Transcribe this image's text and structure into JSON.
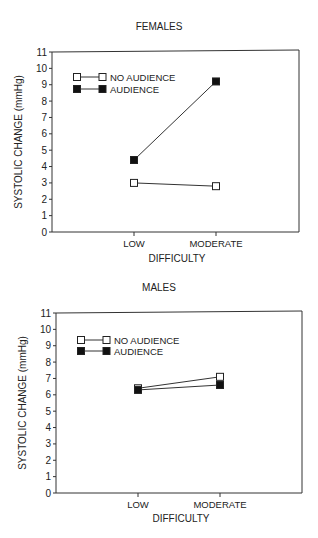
{
  "chart_data": [
    {
      "type": "line",
      "title": "FEMALES",
      "xlabel": "DIFFICULTY",
      "ylabel": "SYSTOLIC CHANGE (mmHg)",
      "categories": [
        "LOW",
        "MODERATE"
      ],
      "ylim": [
        0,
        11
      ],
      "yticks": [
        0,
        1,
        2,
        3,
        4,
        5,
        6,
        7,
        8,
        9,
        10,
        11
      ],
      "grid": false,
      "legend_position": "upper-left",
      "series": [
        {
          "name": "NO AUDIENCE",
          "marker": "open-square",
          "values": [
            3.0,
            2.8
          ]
        },
        {
          "name": "AUDIENCE",
          "marker": "filled-square",
          "values": [
            4.4,
            9.2
          ]
        }
      ]
    },
    {
      "type": "line",
      "title": "MALES",
      "xlabel": "DIFFICULTY",
      "ylabel": "SYSTOLIC CHANGE (mmHg)",
      "categories": [
        "LOW",
        "MODERATE"
      ],
      "ylim": [
        0,
        11
      ],
      "yticks": [
        0,
        1,
        2,
        3,
        4,
        5,
        6,
        7,
        8,
        9,
        10,
        11
      ],
      "grid": false,
      "legend_position": "upper-left",
      "series": [
        {
          "name": "NO AUDIENCE",
          "marker": "open-square",
          "values": [
            6.4,
            7.1
          ]
        },
        {
          "name": "AUDIENCE",
          "marker": "filled-square",
          "values": [
            6.3,
            6.6
          ]
        }
      ]
    }
  ]
}
